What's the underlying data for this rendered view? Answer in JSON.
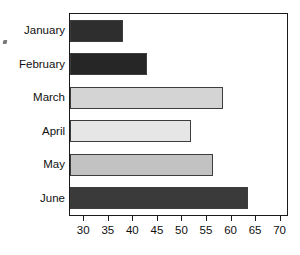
{
  "chart_data": {
    "type": "bar",
    "orientation": "horizontal",
    "title": "",
    "subtitle": "",
    "xlabel": "",
    "ylabel": "",
    "categories": [
      "January",
      "February",
      "March",
      "April",
      "May",
      "June"
    ],
    "values": [
      38,
      43,
      58.5,
      52,
      56.5,
      63.5
    ],
    "series": [
      {
        "name": "",
        "values": [
          38,
          43,
          58.5,
          52,
          56.5,
          63.5
        ]
      }
    ],
    "bar_colors": [
      "#2e2e2e",
      "#262626",
      "#d4d4d4",
      "#e6e6e6",
      "#c2c2c2",
      "#3a3a3a"
    ],
    "bar_edge_color": "#3d3d3d",
    "bar_baseline_value": 27.3,
    "xlim": [
      27.3,
      71.5
    ],
    "xticks": [
      30,
      35,
      40,
      45,
      50,
      55,
      60,
      65,
      70
    ],
    "xtick_labels": [
      "30",
      "35",
      "40",
      "45",
      "50",
      "55",
      "60",
      "65",
      "70"
    ],
    "grid": false,
    "legend": false,
    "legend_position": "none",
    "frame_color": "#1a1a1a",
    "background_color": "#ffffff",
    "annotations": []
  },
  "figure": {
    "speck_name": "scan-artifact"
  }
}
